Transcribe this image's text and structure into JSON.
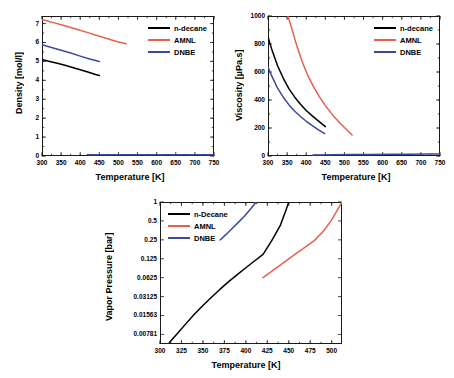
{
  "figure": {
    "series_colors": {
      "n_decane": "#000000",
      "AMNL": "#E8604C",
      "DNBE": "#3A4A9F"
    }
  },
  "chart_data": [
    {
      "type": "line",
      "id": "density",
      "title": "",
      "xlabel": "Temperature [K]",
      "ylabel": "Density [mol/l]",
      "xlim": [
        300,
        750
      ],
      "ylim": [
        0,
        7.4
      ],
      "xticks": [
        300,
        350,
        400,
        450,
        500,
        550,
        600,
        650,
        700,
        750
      ],
      "yticks": [
        0,
        1,
        2,
        3,
        4,
        5,
        6,
        7
      ],
      "grid": false,
      "legend_position": "top-right",
      "legend": [
        "n-decane",
        "AMNL",
        "DNBE"
      ],
      "series": [
        {
          "name": "n-decane",
          "color": "#000000",
          "x": [
            300,
            320,
            340,
            360,
            380,
            400,
            420,
            440,
            450
          ],
          "y": [
            5.1,
            5.0,
            4.9,
            4.8,
            4.68,
            4.56,
            4.44,
            4.31,
            4.25
          ]
        },
        {
          "name": "AMNL",
          "color": "#E8604C",
          "x": [
            300,
            330,
            360,
            390,
            420,
            450,
            480,
            500,
            520
          ],
          "y": [
            7.22,
            7.05,
            6.88,
            6.7,
            6.52,
            6.33,
            6.14,
            6.03,
            5.93
          ]
        },
        {
          "name": "DNBE",
          "color": "#3A4A9F",
          "x": [
            300,
            325,
            350,
            375,
            400,
            425,
            450
          ],
          "y": [
            5.88,
            5.74,
            5.59,
            5.44,
            5.28,
            5.13,
            5.0
          ]
        },
        {
          "name": "DNBE-vapor",
          "color": "#3A4A9F",
          "x": [
            418,
            470,
            520,
            570,
            620,
            670,
            710,
            750
          ],
          "y": [
            0.06,
            0.06,
            0.06,
            0.06,
            0.06,
            0.06,
            0.06,
            0.06
          ]
        }
      ]
    },
    {
      "type": "line",
      "id": "viscosity",
      "title": "",
      "xlabel": "Temperature [K]",
      "ylabel": "Viscosity [µPa.s]",
      "xlim": [
        300,
        750
      ],
      "ylim": [
        0,
        1000
      ],
      "xticks": [
        300,
        350,
        400,
        450,
        500,
        550,
        600,
        650,
        700,
        750
      ],
      "yticks": [
        0,
        200,
        400,
        600,
        800,
        1000
      ],
      "grid": false,
      "legend_position": "top-right",
      "legend": [
        "n-decane",
        "AMNL",
        "DNBE"
      ],
      "series": [
        {
          "name": "n-decane",
          "color": "#000000",
          "x": [
            300,
            310,
            325,
            340,
            355,
            370,
            385,
            400,
            415,
            430,
            450
          ],
          "y": [
            850,
            760,
            645,
            555,
            480,
            420,
            370,
            325,
            288,
            255,
            210
          ]
        },
        {
          "name": "AMNL",
          "color": "#E8604C",
          "x": [
            352,
            360,
            375,
            390,
            405,
            420,
            435,
            450,
            470,
            490,
            520
          ],
          "y": [
            1000,
            930,
            790,
            670,
            570,
            490,
            420,
            360,
            290,
            230,
            150
          ]
        },
        {
          "name": "DNBE",
          "color": "#3A4A9F",
          "x": [
            300,
            310,
            325,
            340,
            355,
            370,
            385,
            400,
            415,
            430,
            448
          ],
          "y": [
            635,
            570,
            485,
            420,
            365,
            320,
            282,
            248,
            218,
            190,
            160
          ]
        },
        {
          "name": "vapor-baseline",
          "color": "#3A4A9F",
          "x": [
            418,
            470,
            520,
            570,
            620,
            670,
            710,
            750
          ],
          "y": [
            8,
            9,
            10,
            11,
            12,
            13,
            14,
            15
          ]
        }
      ]
    },
    {
      "type": "line",
      "id": "vapor-pressure",
      "title": "",
      "xlabel": "Temperature [K]",
      "ylabel": "Vapor Pressure [bar]",
      "xlim": [
        300,
        512
      ],
      "ylim": [
        0.0055,
        1.0
      ],
      "yscale": "log2",
      "xticks": [
        300,
        325,
        350,
        375,
        400,
        425,
        450,
        475,
        500
      ],
      "ytick_labels": [
        "1",
        "0.5",
        "0.25",
        "0.125",
        "0.0625",
        "0.03125",
        "0.01563",
        "0.00781"
      ],
      "ytick_values": [
        1,
        0.5,
        0.25,
        0.125,
        0.0625,
        0.03125,
        0.01563,
        0.00781
      ],
      "grid": false,
      "legend_position": "top-left",
      "legend": [
        "n-Decane",
        "AMNL",
        "DNBE"
      ],
      "series": [
        {
          "name": "n-Decane",
          "color": "#000000",
          "x": [
            311,
            320,
            330,
            340,
            350,
            360,
            370,
            380,
            390,
            400,
            410,
            420,
            430,
            440,
            447,
            450
          ],
          "y": [
            0.0058,
            0.008,
            0.0115,
            0.0163,
            0.0225,
            0.0305,
            0.041,
            0.054,
            0.07,
            0.09,
            0.115,
            0.147,
            0.24,
            0.42,
            0.76,
            1.0
          ]
        },
        {
          "name": "AMNL",
          "color": "#E8604C",
          "x": [
            420,
            430,
            440,
            450,
            460,
            470,
            480,
            490,
            500,
            512
          ],
          "y": [
            0.0625,
            0.079,
            0.099,
            0.124,
            0.156,
            0.195,
            0.245,
            0.34,
            0.52,
            1.0
          ]
        },
        {
          "name": "DNBE",
          "color": "#3A4A9F",
          "x": [
            370,
            377,
            384,
            391,
            398,
            405,
            412
          ],
          "y": [
            0.248,
            0.305,
            0.38,
            0.47,
            0.59,
            0.76,
            1.0
          ]
        }
      ]
    }
  ]
}
